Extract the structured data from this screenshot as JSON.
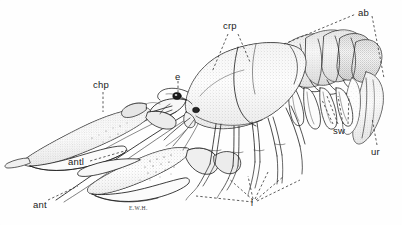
{
  "figure": {
    "kind": "scientific-illustration",
    "background_color": "#fefefe",
    "ink_color": "#1a1a1a",
    "stipple_color": "#6b6b6b",
    "artist_signature": "E.W.H."
  },
  "labels": [
    {
      "id": "chp",
      "text": "chp",
      "x": 93,
      "y": 80,
      "meaning": "cheliped"
    },
    {
      "id": "e",
      "text": "e",
      "x": 175,
      "y": 73,
      "meaning": "eye"
    },
    {
      "id": "crp",
      "text": "crp",
      "x": 223,
      "y": 22,
      "meaning": "carapace"
    },
    {
      "id": "ab",
      "text": "ab",
      "x": 358,
      "y": 9,
      "meaning": "abdomen"
    },
    {
      "id": "sw",
      "text": "sw",
      "x": 333,
      "y": 127,
      "meaning": "swimmerets"
    },
    {
      "id": "ur",
      "text": "ur",
      "x": 371,
      "y": 148,
      "meaning": "uropod"
    },
    {
      "id": "antl",
      "text": "antl",
      "x": 68,
      "y": 158,
      "meaning": "antennule"
    },
    {
      "id": "ant",
      "text": "ant",
      "x": 33,
      "y": 201,
      "meaning": "antenna"
    },
    {
      "id": "l",
      "text": "l",
      "x": 250,
      "y": 199,
      "meaning": "walking legs"
    }
  ],
  "signature": {
    "text": "E.W.H.",
    "x": 129,
    "y": 206
  },
  "leader_lines": {
    "style": "dashed",
    "color": "#333333",
    "dash": "2.4 2.2",
    "width": 0.8
  }
}
